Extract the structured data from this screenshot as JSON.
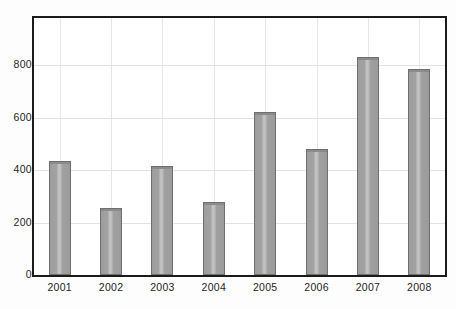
{
  "chart_data": {
    "type": "bar",
    "title": "",
    "subtitle": "",
    "xlabel": "",
    "ylabel": "",
    "categories": [
      "2001",
      "2002",
      "2003",
      "2004",
      "2005",
      "2006",
      "2007",
      "2008"
    ],
    "values": [
      435,
      255,
      415,
      277,
      620,
      480,
      830,
      785
    ],
    "series": [
      {
        "name": "",
        "values": [
          435,
          255,
          415,
          277,
          620,
          480,
          830,
          785
        ]
      }
    ],
    "ylim": [
      0,
      980
    ],
    "y_ticks": [
      0,
      200,
      400,
      600,
      800
    ],
    "y_tick_labels": [
      "0",
      "200",
      "400",
      "600",
      "800"
    ],
    "x_tick_labels": [
      "2001",
      "2002",
      "2003",
      "2004",
      "2005",
      "2006",
      "2007",
      "2008"
    ],
    "grid": {
      "horizontal": true,
      "vertical": true
    },
    "legend": {
      "visible": false,
      "position": "none",
      "entries": []
    },
    "annotations": [],
    "colors": {
      "bar_fill": "#a0a0a0",
      "bar_highlight": "#c3c3c3",
      "bar_edge": "#6f6f6f",
      "frame": "#1b1b1b",
      "grid": "#e2e2e2",
      "background": "#ffffff",
      "text": "#1d1d1d"
    },
    "bar_width_ratio": 0.43
  }
}
